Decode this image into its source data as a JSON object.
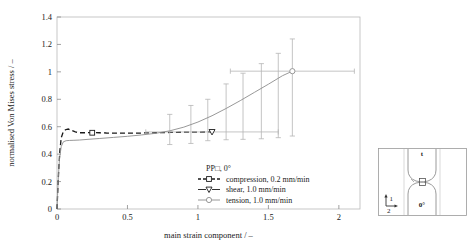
{
  "chart_data": {
    "type": "line",
    "title": "",
    "xlabel": "main strain component / –",
    "ylabel": "normalised Von Mises stress / –",
    "xlim": [
      0,
      2.15
    ],
    "ylim": [
      0,
      1.4
    ],
    "xticks": [
      "0",
      "0.5",
      "1",
      "1.5",
      "2"
    ],
    "xtick_values": [
      0,
      0.5,
      1,
      1.5,
      2
    ],
    "yticks": [
      "0",
      "0.2",
      "0.4",
      "0.6",
      "0.8",
      "1",
      "1.2",
      "1.4"
    ],
    "ytick_values": [
      0,
      0.2,
      0.4,
      0.6,
      0.8,
      1.0,
      1.2,
      1.4
    ],
    "grid": false,
    "legend_position": "inside-lower-right",
    "legend_title": "PP□, 0°",
    "series": [
      {
        "name": "compression, 0.2 mm/min",
        "marker": "square",
        "linestyle": "dashed",
        "color": "#1a1a1a",
        "x": [
          0.0,
          0.005,
          0.012,
          0.02,
          0.03,
          0.045,
          0.06,
          0.08,
          0.1,
          0.13,
          0.16,
          0.2,
          0.25,
          0.3,
          0.35,
          0.42,
          0.5,
          0.6,
          0.7,
          0.8,
          0.9,
          1.0,
          1.1
        ],
        "y": [
          0.0,
          0.12,
          0.28,
          0.42,
          0.52,
          0.565,
          0.578,
          0.583,
          0.575,
          0.562,
          0.556,
          0.556,
          0.557,
          0.556,
          0.554,
          0.553,
          0.553,
          0.554,
          0.556,
          0.558,
          0.56,
          0.561,
          0.562
        ],
        "marker_points": [
          {
            "x": 0.25,
            "y": 0.556
          }
        ],
        "endpoint": {
          "x": 1.1,
          "y": 0.562
        },
        "xerr": 0.0
      },
      {
        "name": "shear, 1.0 mm/min",
        "marker": "triangle-down",
        "linestyle": "solid",
        "color": "#1a1a1a",
        "x": [
          1.1
        ],
        "y": [
          0.562
        ],
        "marker_points": [
          {
            "x": 1.1,
            "y": 0.562
          }
        ],
        "endpoint": {
          "x": 1.1,
          "y": 0.562
        },
        "xerr": 0.47
      },
      {
        "name": "tension, 1.0 mm/min",
        "marker": "circle",
        "linestyle": "solid",
        "color": "#8c8c8c",
        "x": [
          0.0,
          0.004,
          0.01,
          0.018,
          0.03,
          0.045,
          0.065,
          0.09,
          0.12,
          0.16,
          0.22,
          0.3,
          0.4,
          0.5,
          0.6,
          0.7,
          0.8,
          0.9,
          1.0,
          1.1,
          1.2,
          1.3,
          1.4,
          1.5,
          1.6,
          1.67
        ],
        "y": [
          0.0,
          0.1,
          0.24,
          0.37,
          0.455,
          0.49,
          0.498,
          0.5,
          0.501,
          0.503,
          0.508,
          0.514,
          0.522,
          0.53,
          0.54,
          0.552,
          0.57,
          0.597,
          0.634,
          0.68,
          0.733,
          0.79,
          0.85,
          0.91,
          0.972,
          1.005
        ],
        "marker_points": [
          {
            "x": 1.67,
            "y": 1.005
          }
        ],
        "endpoint": {
          "x": 1.67,
          "y": 1.005
        },
        "xerr": 0.44,
        "errorbars": [
          {
            "x": 0.8,
            "y": 0.57,
            "lo": 0.47,
            "hi": 0.69
          },
          {
            "x": 0.95,
            "y": 0.612,
            "lo": 0.478,
            "hi": 0.755
          },
          {
            "x": 1.07,
            "y": 0.662,
            "lo": 0.498,
            "hi": 0.8
          },
          {
            "x": 1.2,
            "y": 0.733,
            "lo": 0.505,
            "hi": 0.912
          },
          {
            "x": 1.32,
            "y": 0.8,
            "lo": 0.508,
            "hi": 0.99
          },
          {
            "x": 1.45,
            "y": 0.878,
            "lo": 0.512,
            "hi": 1.06
          },
          {
            "x": 1.57,
            "y": 0.948,
            "lo": 0.52,
            "hi": 1.135
          },
          {
            "x": 1.67,
            "y": 1.005,
            "lo": 0.532,
            "hi": 1.24
          }
        ]
      }
    ]
  },
  "legend": {
    "title": "PP□, 0°",
    "items": [
      {
        "label": "compression, 0.2 mm/min",
        "marker": "square",
        "style": "dashed"
      },
      {
        "label": "shear, 1.0 mm/min",
        "marker": "triangle-down",
        "style": "solid"
      },
      {
        "label": "tension, 1.0 mm/min",
        "marker": "circle",
        "style": "solid"
      }
    ]
  },
  "inset": {
    "thickness_label": "t",
    "angle_label": "0°",
    "axis_1_label": "1",
    "axis_2_label": "2",
    "specimen_label": ""
  }
}
